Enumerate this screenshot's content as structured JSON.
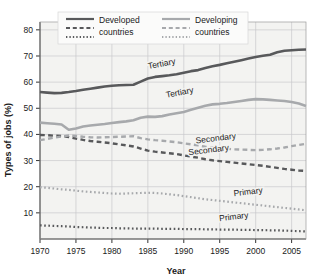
{
  "chart_data": {
    "type": "line",
    "title": "",
    "xlabel": "Year",
    "ylabel": "Types of jobs (%)",
    "xlim": [
      1970,
      2007
    ],
    "ylim": [
      0,
      83
    ],
    "yticks": [
      10,
      20,
      30,
      40,
      50,
      60,
      70,
      80
    ],
    "ytick_labels": [
      "10",
      "20",
      "30",
      "40",
      "50",
      "60",
      "70",
      "80"
    ],
    "xticks": [
      1970,
      1975,
      1980,
      1985,
      1990,
      1995,
      2000,
      2005
    ],
    "xtick_labels": [
      "1970",
      "1975",
      "1980",
      "1985",
      "1990",
      "1995",
      "2000",
      "2005"
    ],
    "grid": true,
    "legend_position": "top-center",
    "colors": {
      "developed": "#58595b",
      "developing": "#a7a9ac",
      "grid": "#c8c8cc",
      "axis": "#333333",
      "plot_background": "#f3f3f1"
    },
    "x": [
      1970,
      1971,
      1972,
      1973,
      1974,
      1975,
      1976,
      1977,
      1978,
      1979,
      1980,
      1981,
      1982,
      1983,
      1984,
      1985,
      1986,
      1987,
      1988,
      1989,
      1990,
      1991,
      1992,
      1993,
      1994,
      1995,
      1996,
      1997,
      1998,
      1999,
      2000,
      2001,
      2002,
      2003,
      2004,
      2005,
      2006,
      2007
    ],
    "series": [
      {
        "name": "Developed countries Tertiary",
        "group": "Developed countries",
        "sector": "Tertiary",
        "style": "solid",
        "color": "#58595b",
        "label": "Tertiary",
        "values": [
          56.2,
          56.0,
          55.8,
          55.9,
          56.2,
          56.6,
          57.1,
          57.5,
          57.9,
          58.3,
          58.6,
          58.8,
          58.9,
          59.0,
          60.2,
          61.4,
          62.0,
          62.3,
          62.6,
          63.0,
          63.6,
          64.2,
          64.6,
          65.4,
          66.1,
          66.6,
          67.2,
          67.8,
          68.4,
          69.0,
          69.6,
          70.1,
          70.5,
          71.4,
          72.0,
          72.2,
          72.4,
          72.5
        ]
      },
      {
        "name": "Developing countries Tertiary",
        "group": "Developing countries",
        "sector": "Tertiary",
        "style": "solid",
        "color": "#a7a9ac",
        "label": "Tertiary",
        "values": [
          44.5,
          44.3,
          44.1,
          43.8,
          41.8,
          42.3,
          43.0,
          43.4,
          43.7,
          44.0,
          44.4,
          44.7,
          45.0,
          45.4,
          46.4,
          46.8,
          46.7,
          47.0,
          47.6,
          48.1,
          48.6,
          49.4,
          50.2,
          51.0,
          51.5,
          51.7,
          52.0,
          52.4,
          52.8,
          53.2,
          53.5,
          53.4,
          53.2,
          53.0,
          52.8,
          52.4,
          51.8,
          50.9
        ]
      },
      {
        "name": "Developed countries Secondary",
        "group": "Developed countries",
        "sector": "Secondary",
        "style": "dashed",
        "color": "#58595b",
        "label": "Secondary",
        "values": [
          39.8,
          39.7,
          39.5,
          39.4,
          39.0,
          38.4,
          37.9,
          37.5,
          37.2,
          36.9,
          36.6,
          36.2,
          35.8,
          35.4,
          34.6,
          33.8,
          33.4,
          33.1,
          32.8,
          32.5,
          32.0,
          31.5,
          31.1,
          30.5,
          30.1,
          29.8,
          29.5,
          29.2,
          28.9,
          28.6,
          28.3,
          28.0,
          27.6,
          27.2,
          26.8,
          26.5,
          26.2,
          26.0
        ]
      },
      {
        "name": "Developing countries Secondary",
        "group": "Developing countries",
        "sector": "Secondary",
        "style": "dashed",
        "color": "#a7a9ac",
        "label": "Secondary",
        "values": [
          37.8,
          38.3,
          38.8,
          39.2,
          39.6,
          39.4,
          39.1,
          38.9,
          38.8,
          38.9,
          39.0,
          39.1,
          39.2,
          39.3,
          38.6,
          38.1,
          37.8,
          37.6,
          37.3,
          37.0,
          36.6,
          36.2,
          35.8,
          35.3,
          35.0,
          34.7,
          34.5,
          34.3,
          34.2,
          34.1,
          34.0,
          34.1,
          34.3,
          34.6,
          35.0,
          35.5,
          36.0,
          36.4
        ]
      },
      {
        "name": "Developing countries Primary",
        "group": "Developing countries",
        "sector": "Primary",
        "style": "dotted",
        "color": "#a7a9ac",
        "label": "Primary",
        "values": [
          19.8,
          19.6,
          19.3,
          19.0,
          18.8,
          18.5,
          18.2,
          18.0,
          17.8,
          17.6,
          17.4,
          17.3,
          17.4,
          17.5,
          17.6,
          17.7,
          17.6,
          17.4,
          17.1,
          16.8,
          16.4,
          16.0,
          15.6,
          15.2,
          14.9,
          14.6,
          14.3,
          14.0,
          13.7,
          13.4,
          13.1,
          12.8,
          12.5,
          12.2,
          11.9,
          11.6,
          11.3,
          11.0
        ]
      },
      {
        "name": "Developed countries Primary",
        "group": "Developed countries",
        "sector": "Primary",
        "style": "dotted",
        "color": "#58595b",
        "label": "Primary",
        "values": [
          5.2,
          5.1,
          5.0,
          4.9,
          4.8,
          4.6,
          4.5,
          4.4,
          4.3,
          4.2,
          4.2,
          4.1,
          4.1,
          4.0,
          4.0,
          4.0,
          4.0,
          3.9,
          3.9,
          3.9,
          3.8,
          3.8,
          3.8,
          3.7,
          3.7,
          3.6,
          3.6,
          3.6,
          3.5,
          3.5,
          3.4,
          3.4,
          3.3,
          3.3,
          3.2,
          3.1,
          3.0,
          2.9
        ]
      }
    ],
    "annotations": [
      {
        "text": "Tertiary",
        "series": "Developed countries Tertiary",
        "x": 1987.0,
        "y": 66.0
      },
      {
        "text": "Tertiary",
        "series": "Developing countries Tertiary",
        "x": 1989.5,
        "y": 55.0
      },
      {
        "text": "Secondary",
        "series": "Developing countries Secondary",
        "x": 1994.5,
        "y": 37.5
      },
      {
        "text": "Secondary",
        "series": "Developed countries Secondary",
        "x": 1993.5,
        "y": 33.0
      },
      {
        "text": "Primary",
        "series": "Developing countries Primary",
        "x": 1999.0,
        "y": 17.0
      },
      {
        "text": "Primary",
        "series": "Developed countries Primary",
        "x": 1997.0,
        "y": 7.5
      }
    ]
  },
  "legend": {
    "entries": [
      {
        "label_line1": "Developed",
        "label_line2": "countries",
        "color": "#58595b"
      },
      {
        "label_line1": "Developing",
        "label_line2": "countries",
        "color": "#a7a9ac"
      }
    ]
  }
}
